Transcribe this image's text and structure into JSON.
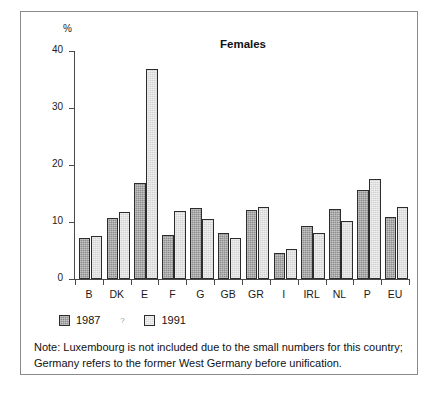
{
  "figure": {
    "unit_label": "%",
    "title": "Females",
    "legend": {
      "items": [
        {
          "label": "1987",
          "color": "#8c8c8c"
        },
        {
          "label": "1991",
          "color": "#dcdcdc"
        }
      ],
      "separator": "?"
    },
    "note": {
      "line1": "Note: Luxembourg is not included due to the small numbers for this country;",
      "line2": "Germany refers to the former West Germany before unification."
    }
  },
  "chart_data": {
    "type": "bar",
    "title": "Females",
    "xlabel": "",
    "ylabel": "%",
    "ylim": [
      0,
      40
    ],
    "yticks": [
      0,
      10,
      20,
      30,
      40
    ],
    "grid": false,
    "legend_position": "below-axes-left",
    "categories": [
      "B",
      "DK",
      "E",
      "F",
      "G",
      "GB",
      "GR",
      "I",
      "IRL",
      "NL",
      "P",
      "EU"
    ],
    "series": [
      {
        "name": "1987",
        "color": "#8c8c8c",
        "values": [
          7.2,
          10.7,
          16.8,
          7.7,
          12.5,
          8.0,
          12.1,
          4.5,
          9.3,
          12.2,
          15.7,
          10.8
        ]
      },
      {
        "name": "1991",
        "color": "#dcdcdc",
        "values": [
          7.5,
          11.8,
          36.8,
          12.0,
          10.6,
          7.2,
          12.7,
          5.3,
          8.1,
          10.2,
          17.6,
          12.6
        ]
      }
    ]
  }
}
